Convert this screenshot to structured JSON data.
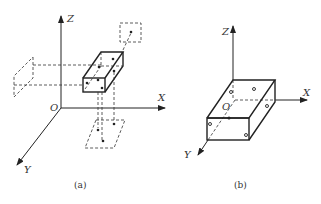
{
  "figure_a": {
    "caption": "(a)",
    "axes": {
      "x": "X",
      "y": "Y",
      "z": "Z",
      "origin": "O"
    }
  },
  "figure_b": {
    "caption": "(b)",
    "axes": {
      "x": "X",
      "y": "Y",
      "z": "Z",
      "origin": "O"
    }
  },
  "colors": {
    "line": "#222222",
    "background": "#ffffff"
  }
}
